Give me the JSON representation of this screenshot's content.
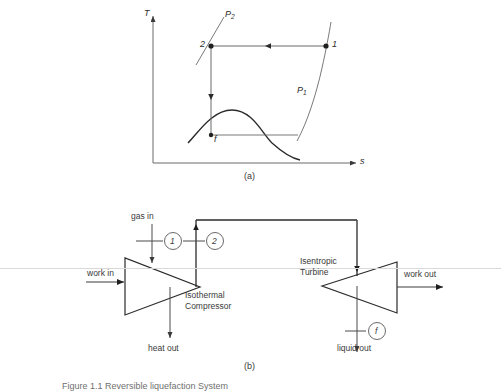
{
  "figure": {
    "caption_a": "(a)",
    "caption_b": "(b)",
    "bottom_caption": "Figure 1.1  Reversible liquefaction System"
  },
  "ts_diagram": {
    "axis_y_label": "T",
    "axis_x_label": "s",
    "points": [
      {
        "id": "pt-1",
        "label": "1"
      },
      {
        "id": "pt-2",
        "label": "2"
      },
      {
        "id": "pt-f",
        "label": "f"
      }
    ],
    "isobars": [
      {
        "id": "p1",
        "base": "P",
        "sub": "1"
      },
      {
        "id": "p2",
        "base": "P",
        "sub": "2"
      }
    ]
  },
  "flow_diagram": {
    "streams": {
      "gas_in": "gas in",
      "work_in": "work in",
      "heat_out": "heat out",
      "work_out": "work out",
      "liquid_out": "liquid out"
    },
    "nodes": [
      {
        "id": "node-1",
        "label": "1"
      },
      {
        "id": "node-2",
        "label": "2"
      },
      {
        "id": "node-f",
        "label": "f"
      }
    ],
    "components": {
      "compressor_line1": "Isothermal",
      "compressor_line2": "Compressor",
      "turbine_line1": "Isentropic",
      "turbine_line2": "Turbine"
    }
  },
  "colors": {
    "line": "#4a4a4a",
    "dark_line": "#2b2b2b",
    "text": "#2b2b2b",
    "scanline": "#d9d9d9"
  }
}
